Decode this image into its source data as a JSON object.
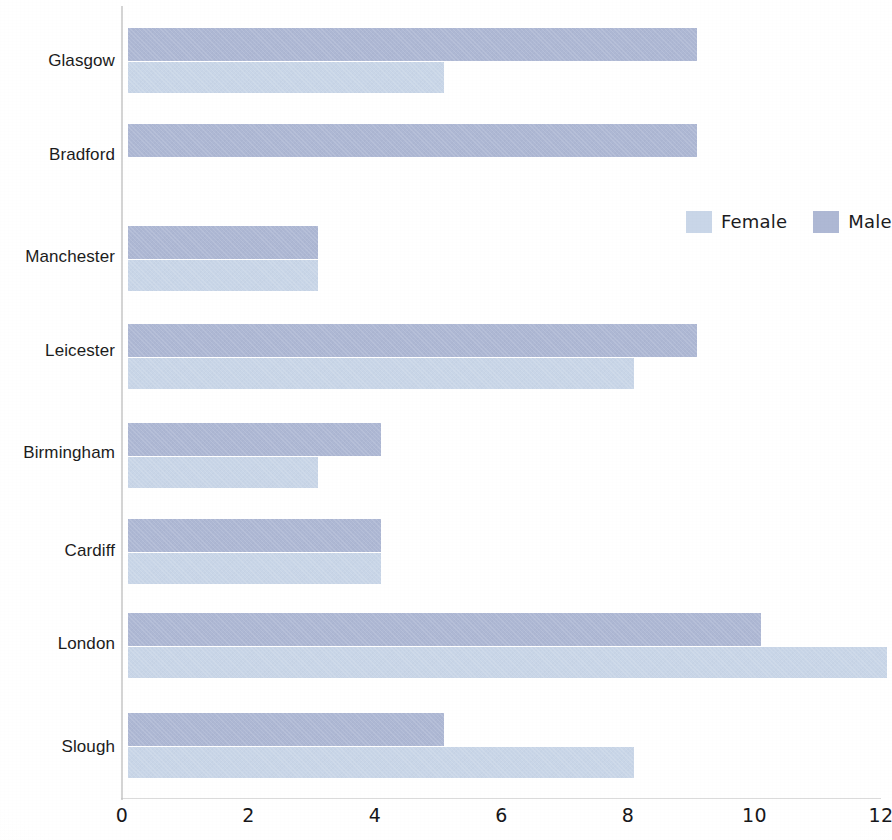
{
  "chart_data": {
    "type": "bar",
    "orientation": "horizontal",
    "title": "",
    "subtitle": "",
    "xlabel": "",
    "ylabel": "",
    "xlim": [
      0,
      12
    ],
    "ylim": null,
    "grid": false,
    "legend_position": "upper right inside plot",
    "x_ticks": [
      0,
      2,
      4,
      6,
      8,
      10,
      12
    ],
    "x_tick_labels": [
      "0",
      "2",
      "4",
      "6",
      "8",
      "10",
      "12"
    ],
    "categories": [
      "Glasgow",
      "Bradford",
      "Manchester",
      "Leicester",
      "Birmingham",
      "Cardiff",
      "London",
      "Slough"
    ],
    "series": [
      {
        "name": "Male",
        "color": "#aeb8d4",
        "values": [
          9,
          9,
          3,
          9,
          4,
          4,
          10,
          5
        ]
      },
      {
        "name": "Female",
        "color": "#c9d6e8",
        "values": [
          5,
          0,
          3,
          8,
          3,
          4,
          12,
          8
        ]
      }
    ],
    "legend": [
      {
        "label": "Female",
        "color": "#c9d6e8"
      },
      {
        "label": "Male",
        "color": "#aeb8d4"
      }
    ]
  },
  "axis": {
    "baseline_color": "#d4d4d4"
  }
}
